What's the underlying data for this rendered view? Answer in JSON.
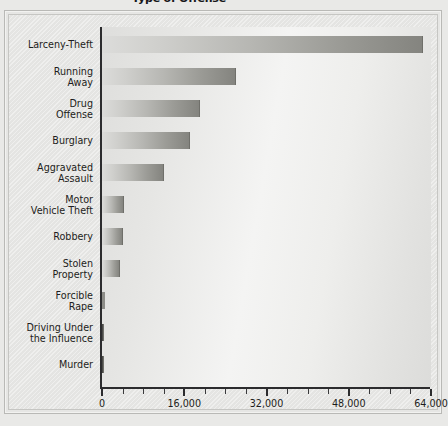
{
  "chart_data": {
    "type": "bar",
    "orientation": "horizontal",
    "title": "Type of Offense",
    "xlabel": "",
    "ylabel": "",
    "xlim": [
      0,
      64000
    ],
    "grid": false,
    "legend": null,
    "xticks": [
      "0",
      "16,000",
      "32,000",
      "48,000",
      "64,000"
    ],
    "xtick_values": [
      0,
      16000,
      32000,
      48000,
      64000
    ],
    "minor_tick_step": 4000,
    "categories": [
      "Larceny-Theft",
      "Running\nAway",
      "Drug\nOffense",
      "Burglary",
      "Aggravated\nAssault",
      "Motor\nVehicle Theft",
      "Robbery",
      "Stolen\nProperty",
      "Forcible\nRape",
      "Driving Under\nthe Influence",
      "Murder"
    ],
    "values": [
      62200,
      25900,
      18900,
      17000,
      11900,
      4100,
      3900,
      3300,
      600,
      150,
      80
    ],
    "bar_color_start": "#dcdcda",
    "bar_color_end": "#84847f",
    "axis_color": "#2c2c2e",
    "background_color": "#e8e8e6"
  }
}
